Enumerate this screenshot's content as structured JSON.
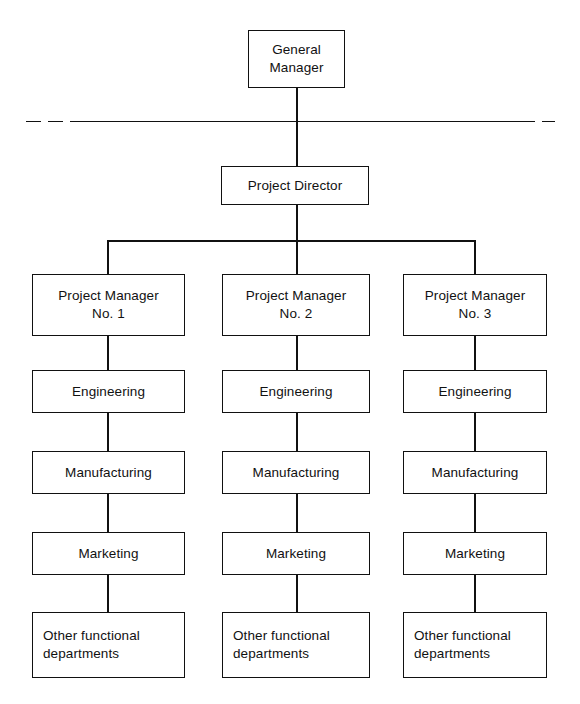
{
  "diagram": {
    "type": "organization-chart",
    "line_color": "#111111",
    "background_color": "#ffffff",
    "top": {
      "general_manager": "General\nManager",
      "project_director": "Project Director"
    },
    "separator": {
      "style": "dashed-ends-solid-middle",
      "label": ""
    },
    "columns": [
      {
        "manager": "Project Manager\nNo. 1",
        "functions": [
          "Engineering",
          "Manufacturing",
          "Marketing",
          "Other functional\ndepartments"
        ]
      },
      {
        "manager": "Project Manager\nNo. 2",
        "functions": [
          "Engineering",
          "Manufacturing",
          "Marketing",
          "Other functional\ndepartments"
        ]
      },
      {
        "manager": "Project Manager\nNo. 3",
        "functions": [
          "Engineering",
          "Manufacturing",
          "Marketing",
          "Other functional\ndepartments"
        ]
      }
    ]
  }
}
